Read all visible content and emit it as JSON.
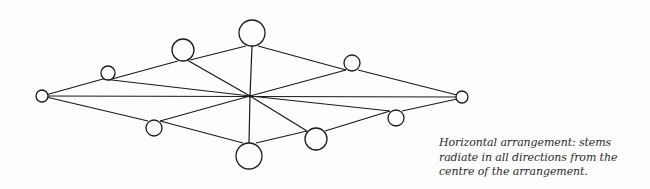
{
  "diagram": {
    "title": "Horizontal arrangement",
    "stroke_color": "#1a1a1a",
    "background": "#fdfdfd",
    "center": {
      "x": 250,
      "y": 96
    },
    "nodes": [
      {
        "id": "left-tip",
        "x": 42,
        "y": 96,
        "r": 6
      },
      {
        "id": "upper-left-small",
        "x": 108,
        "y": 73,
        "r": 7
      },
      {
        "id": "upper-left-medium",
        "x": 183,
        "y": 50,
        "r": 11
      },
      {
        "id": "top",
        "x": 252,
        "y": 33,
        "r": 13
      },
      {
        "id": "upper-right-small",
        "x": 352,
        "y": 63,
        "r": 8
      },
      {
        "id": "right-tip",
        "x": 462,
        "y": 97,
        "r": 6
      },
      {
        "id": "lower-left-small",
        "x": 154,
        "y": 128,
        "r": 8
      },
      {
        "id": "bottom",
        "x": 249,
        "y": 156,
        "r": 13
      },
      {
        "id": "lower-right-medium",
        "x": 316,
        "y": 139,
        "r": 11
      },
      {
        "id": "lower-right-small",
        "x": 396,
        "y": 118,
        "r": 8
      }
    ],
    "edges": [
      [
        [
          42,
          96
        ],
        [
          462,
          97
        ]
      ],
      [
        [
          42,
          96
        ],
        [
          103,
          79
        ]
      ],
      [
        [
          103,
          79
        ],
        [
          250,
          96
        ]
      ],
      [
        [
          112,
          79
        ],
        [
          178,
          61
        ]
      ],
      [
        [
          187,
          60
        ],
        [
          250,
          96
        ]
      ],
      [
        [
          190,
          60
        ],
        [
          246,
          46
        ]
      ],
      [
        [
          252,
          46
        ],
        [
          250,
          96
        ]
      ],
      [
        [
          258,
          46
        ],
        [
          346,
          70
        ]
      ],
      [
        [
          346,
          70
        ],
        [
          250,
          96
        ]
      ],
      [
        [
          358,
          70
        ],
        [
          457,
          95
        ]
      ],
      [
        [
          42,
          96
        ],
        [
          148,
          121
        ]
      ],
      [
        [
          160,
          121
        ],
        [
          250,
          96
        ]
      ],
      [
        [
          160,
          121
        ],
        [
          243,
          143
        ]
      ],
      [
        [
          249,
          143
        ],
        [
          250,
          96
        ]
      ],
      [
        [
          256,
          143
        ],
        [
          307,
          131
        ]
      ],
      [
        [
          307,
          131
        ],
        [
          250,
          96
        ]
      ],
      [
        [
          325,
          131
        ],
        [
          390,
          111
        ]
      ],
      [
        [
          390,
          111
        ],
        [
          250,
          96
        ]
      ],
      [
        [
          402,
          111
        ],
        [
          457,
          99
        ]
      ]
    ]
  },
  "caption": {
    "line1": "Horizontal arrangement: stems",
    "line2": "radiate in all directions from the",
    "line3": "centre of the arrangement."
  }
}
